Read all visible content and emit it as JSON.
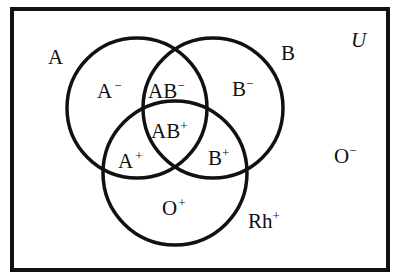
{
  "diagram": {
    "type": "venn",
    "universe": {
      "label": "U",
      "x": 12,
      "y": 9,
      "width": 376,
      "height": 261
    },
    "sets": [
      {
        "id": "A",
        "label": "A",
        "cx": 137,
        "cy": 108,
        "r": 70
      },
      {
        "id": "B",
        "label": "B",
        "cx": 213,
        "cy": 108,
        "r": 70
      },
      {
        "id": "Rh",
        "label": "Rh",
        "label_sup": "+",
        "cx": 175,
        "cy": 173,
        "r": 72
      }
    ],
    "set_labels": [
      {
        "id": "A",
        "base": "A",
        "sup": "",
        "x": 48,
        "y": 64
      },
      {
        "id": "B",
        "base": "B",
        "sup": "",
        "x": 281,
        "y": 60
      },
      {
        "id": "Rh",
        "base": "Rh",
        "sup": "+",
        "x": 248,
        "y": 228
      },
      {
        "id": "U",
        "base": "U",
        "sup": "",
        "x": 351,
        "y": 47
      }
    ],
    "regions": [
      {
        "id": "A-neg",
        "base": "A",
        "sup": "−",
        "x": 97,
        "y": 98
      },
      {
        "id": "AB-neg",
        "base": "AB",
        "sup": "−",
        "x": 148,
        "y": 98
      },
      {
        "id": "B-neg",
        "base": "B",
        "sup": "−",
        "x": 232,
        "y": 96
      },
      {
        "id": "AB-pos",
        "base": "AB",
        "sup": "+",
        "x": 151,
        "y": 138
      },
      {
        "id": "A-pos",
        "base": "A",
        "sup": "+",
        "x": 118,
        "y": 168
      },
      {
        "id": "B-pos",
        "base": "B",
        "sup": "+",
        "x": 208,
        "y": 165
      },
      {
        "id": "O-pos",
        "base": "O",
        "sup": "+",
        "x": 162,
        "y": 215
      },
      {
        "id": "O-neg",
        "base": "O",
        "sup": "−",
        "x": 334,
        "y": 163
      }
    ],
    "colors": {
      "stroke": "#111111",
      "background": "#ffffff"
    }
  }
}
